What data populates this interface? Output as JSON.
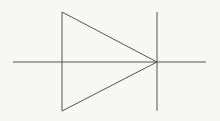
{
  "diagram": {
    "type": "diode-schematic-symbol",
    "background": "#f7f7f6",
    "stroke_color": "#555555",
    "stroke_width": 1,
    "lead_line": {
      "x1": 13,
      "y1": 62,
      "x2": 206,
      "y2": 62
    },
    "triangle": {
      "points": "62,12 62,111 157,62"
    },
    "cathode_bar": {
      "x1": 157,
      "y1": 12,
      "x2": 157,
      "y2": 111
    }
  }
}
